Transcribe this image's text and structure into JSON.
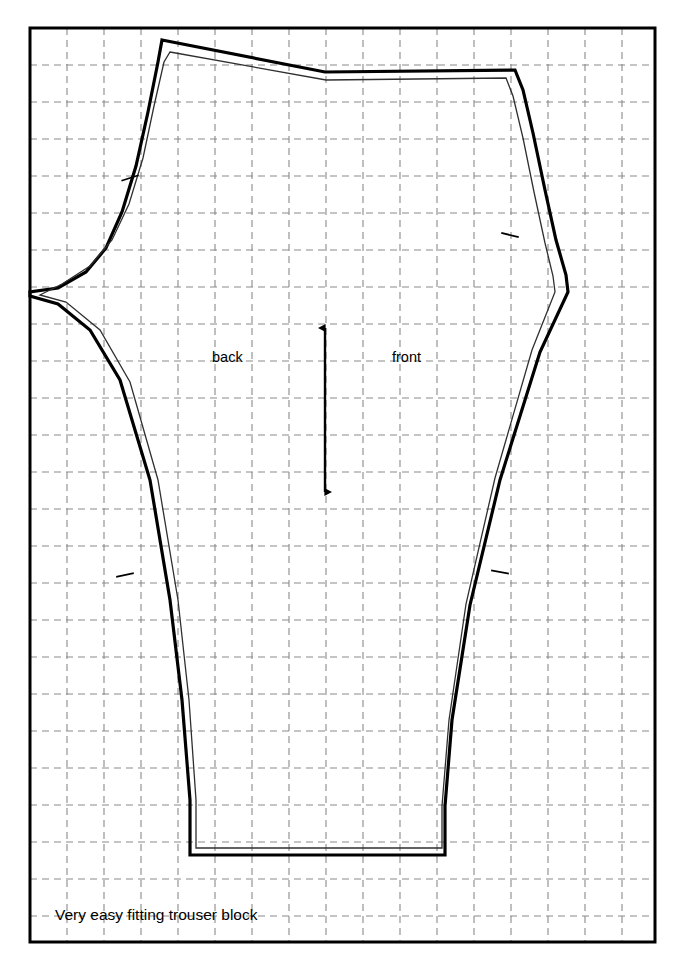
{
  "page": {
    "folio": "186",
    "width": 683,
    "height": 972,
    "background": "#ffffff"
  },
  "caption": {
    "text": "Very easy fitting trouser block"
  },
  "labels": {
    "back": "back",
    "front": "front"
  },
  "colors": {
    "ink": "#000000",
    "grid": "#8a8a8a",
    "frame": "#000000",
    "block_outer": "#000000",
    "block_inner": "#3a3a3a",
    "paper": "#ffffff"
  },
  "frame": {
    "x": 30,
    "y": 28,
    "width": 625,
    "height": 914,
    "stroke_width": 3
  },
  "grid": {
    "style": "dashed",
    "stroke": "#8a8a8a",
    "stroke_width": 1.1,
    "dash": "7 5",
    "spacing_x": 37,
    "spacing_y": 37,
    "origin_x": 30,
    "origin_y": 28,
    "columns": 16,
    "rows": 24
  },
  "chart_data": {
    "type": "line",
    "title": "Very easy fitting trouser block",
    "xlabel": "",
    "ylabel": "",
    "annotations": [
      "back",
      "front"
    ],
    "grid": true,
    "legend": "none",
    "xlim": [
      30,
      655
    ],
    "ylim": [
      28,
      942
    ],
    "series": [
      {
        "name": "back-block-outline",
        "stroke": "#000000",
        "stroke_width": 3.2,
        "closed": true,
        "points": [
          [
            162,
            40
          ],
          [
            325,
            72
          ],
          [
            515,
            70
          ],
          [
            523,
            90
          ],
          [
            533,
            133
          ],
          [
            545,
            190
          ],
          [
            556,
            240
          ],
          [
            566,
            275
          ],
          [
            568,
            292
          ],
          [
            540,
            352
          ],
          [
            500,
            480
          ],
          [
            470,
            605
          ],
          [
            452,
            720
          ],
          [
            445,
            806
          ],
          [
            445,
            855
          ],
          [
            190,
            855
          ],
          [
            190,
            800
          ],
          [
            182,
            700
          ],
          [
            170,
            600
          ],
          [
            150,
            480
          ],
          [
            120,
            380
          ],
          [
            90,
            330
          ],
          [
            58,
            304
          ],
          [
            30,
            296
          ],
          [
            30,
            292
          ],
          [
            58,
            288
          ],
          [
            86,
            272
          ],
          [
            106,
            248
          ],
          [
            122,
            212
          ],
          [
            136,
            166
          ],
          [
            148,
            112
          ],
          [
            158,
            62
          ],
          [
            162,
            40
          ]
        ]
      },
      {
        "name": "front-block-outline",
        "stroke": "#2f2f2f",
        "stroke_width": 1.3,
        "closed": true,
        "points": [
          [
            170,
            52
          ],
          [
            326,
            80
          ],
          [
            506,
            78
          ],
          [
            513,
            96
          ],
          [
            523,
            138
          ],
          [
            534,
            192
          ],
          [
            545,
            243
          ],
          [
            553,
            276
          ],
          [
            555,
            292
          ],
          [
            532,
            350
          ],
          [
            495,
            478
          ],
          [
            466,
            604
          ],
          [
            449,
            720
          ],
          [
            442,
            806
          ],
          [
            442,
            848
          ],
          [
            196,
            848
          ],
          [
            196,
            800
          ],
          [
            189,
            700
          ],
          [
            178,
            600
          ],
          [
            158,
            480
          ],
          [
            130,
            382
          ],
          [
            100,
            330
          ],
          [
            66,
            302
          ],
          [
            40,
            295
          ],
          [
            62,
            284
          ],
          [
            90,
            266
          ],
          [
            112,
            240
          ],
          [
            129,
            204
          ],
          [
            143,
            158
          ],
          [
            154,
            106
          ],
          [
            164,
            62
          ],
          [
            170,
            52
          ]
        ]
      }
    ],
    "grainline": {
      "name": "grain-line-arrow",
      "x": 325,
      "y_top": 328,
      "y_bottom": 492,
      "double_headed": true,
      "stroke": "#000000",
      "stroke_width": 2.4
    },
    "notches": [
      {
        "name": "notch-back-upper-side",
        "x": 130,
        "y": 178,
        "angle": -18
      },
      {
        "name": "notch-front-upper-side",
        "x": 510,
        "y": 235,
        "angle": 14
      },
      {
        "name": "notch-back-lower-side",
        "x": 125,
        "y": 575,
        "angle": -12
      },
      {
        "name": "notch-front-lower-side",
        "x": 500,
        "y": 572,
        "angle": 10
      }
    ]
  }
}
